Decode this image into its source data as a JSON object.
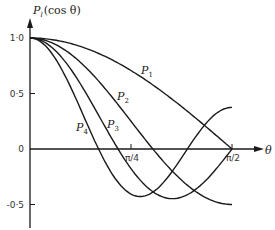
{
  "chart_data": {
    "type": "line",
    "title": "",
    "ylabel": "P_l(cos θ)",
    "xlabel": "θ",
    "x_range": [
      0,
      1.5708
    ],
    "ylim": [
      -0.6,
      1.0
    ],
    "grid": false,
    "legend": "inline curve labels",
    "x_ticks": [
      {
        "value": 0.7854,
        "label": "π/4"
      },
      {
        "value": 1.5708,
        "label": "π/2"
      }
    ],
    "y_ticks": [
      {
        "value": 1.0,
        "label": "1·0"
      },
      {
        "value": 0.5,
        "label": "0·5"
      },
      {
        "value": 0.0,
        "label": "0"
      },
      {
        "value": -0.5,
        "label": "-0·5"
      }
    ],
    "series": [
      {
        "name": "P1",
        "label_main": "P",
        "label_sub": "1",
        "formula": "cos θ",
        "x": [
          0,
          0.3927,
          0.7854,
          1.1781,
          1.5708
        ],
        "values": [
          1.0,
          0.924,
          0.707,
          0.383,
          0.0
        ]
      },
      {
        "name": "P2",
        "label_main": "P",
        "label_sub": "2",
        "formula": "(3cos²θ−1)/2",
        "x": [
          0,
          0.3927,
          0.7854,
          0.9553,
          1.1781,
          1.5708
        ],
        "values": [
          1.0,
          0.78,
          0.25,
          0.0,
          -0.28,
          -0.5
        ]
      },
      {
        "name": "P3",
        "label_main": "P",
        "label_sub": "3",
        "formula": "(5cos³θ−3cosθ)/2",
        "x": [
          0,
          0.3927,
          0.6847,
          0.7854,
          1.1071,
          1.5708
        ],
        "values": [
          1.0,
          0.587,
          0.0,
          -0.177,
          -0.447,
          0.0
        ]
      },
      {
        "name": "P4",
        "label_main": "P",
        "label_sub": "4",
        "formula": "(35cos⁴θ−30cos²θ+3)/8",
        "x": [
          0,
          0.3927,
          0.5307,
          0.7854,
          1.0,
          1.5708
        ],
        "values": [
          1.0,
          0.366,
          0.0,
          -0.406,
          -0.28,
          0.375
        ]
      }
    ]
  },
  "labels": {
    "y_axis_title_main": "P",
    "y_axis_title_sub": "l",
    "y_axis_title_rest": "(cos θ)",
    "x_axis_title": "θ"
  },
  "colors": {
    "ink": "#1a1a1a",
    "background": "#ffffff"
  }
}
